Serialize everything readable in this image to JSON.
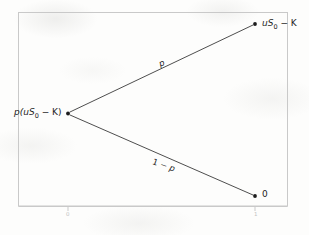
{
  "figure": {
    "type": "one-period-binomial-tree",
    "nodes": {
      "root": {
        "label_prefix": "p(u",
        "label_base": "S",
        "label_sub": "0",
        "label_suffix": " − K)",
        "x": 68,
        "y": 113
      },
      "upper_terminal": {
        "label_prefix": "u",
        "label_base": "S",
        "label_sub": "0",
        "label_suffix": " − K",
        "x": 255,
        "y": 24
      },
      "lower_terminal": {
        "label": "0",
        "x": 255,
        "y": 196
      }
    },
    "edges": {
      "up": {
        "label": "p"
      },
      "down": {
        "label_prefix": "1 − ",
        "label_var": "p"
      }
    },
    "axis": {
      "ticks": [
        {
          "label": "0",
          "x": 68
        },
        {
          "label": "1",
          "x": 255
        }
      ]
    },
    "colors": {
      "frame": "#c9c9c9",
      "edge_line": "#3a3a3a",
      "node_dot": "#1c1c1c",
      "text": "#242424",
      "tick_text": "#c2c2c2",
      "background": "#fdfdfc"
    }
  }
}
